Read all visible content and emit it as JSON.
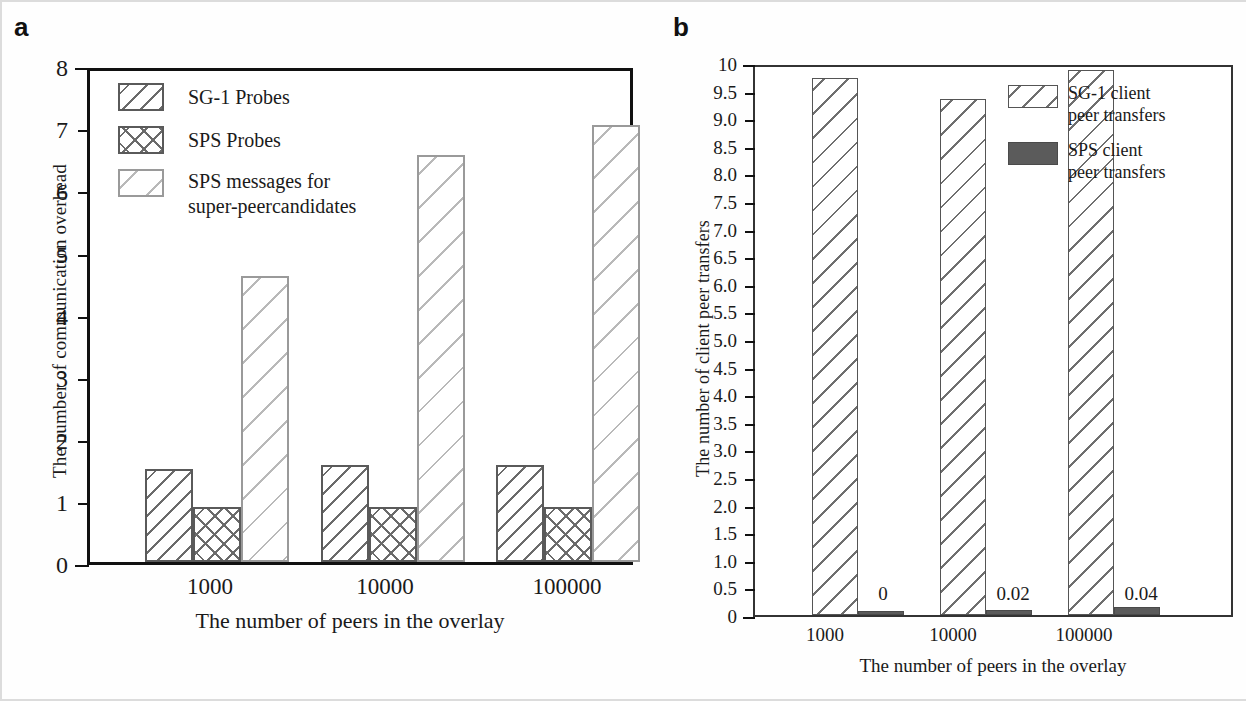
{
  "panels": {
    "a": {
      "letter": "a"
    },
    "b": {
      "letter": "b"
    }
  },
  "chart_data": [
    {
      "type": "bar",
      "panel": "a",
      "title": "",
      "xlabel": "The number of peers in the overlay",
      "ylabel": "The number of communication overhead",
      "categories": [
        "1000",
        "10000",
        "100000"
      ],
      "ylim": [
        0,
        8
      ],
      "yticks": [
        "0",
        "1",
        "2",
        "3",
        "4",
        "5",
        "6",
        "7",
        "8"
      ],
      "grid": false,
      "legend_position": "inside-top-left",
      "series": [
        {
          "name": "SG-1 Probes",
          "pattern": "dense-diagonal-hatch",
          "values": [
            1.5,
            1.56,
            1.56
          ]
        },
        {
          "name": "SPS Probes",
          "pattern": "cross-hatch",
          "values": [
            0.88,
            0.88,
            0.88
          ]
        },
        {
          "name": "SPS messages for\nsuper-peercandidates",
          "pattern": "light-diagonal-hatch",
          "values": [
            4.6,
            6.55,
            7.03
          ]
        }
      ]
    },
    {
      "type": "bar",
      "panel": "b",
      "title": "",
      "xlabel": "The number of peers in the overlay",
      "ylabel": "The number of client peer transfers",
      "categories": [
        "1000",
        "10000",
        "100000"
      ],
      "ylim": [
        0,
        10
      ],
      "yticks": [
        "0",
        "0.5",
        "1.0",
        "1.5",
        "2.0",
        "2.5",
        "3.0",
        "3.5",
        "4.0",
        "4.5",
        "5.0",
        "5.5",
        "6.0",
        "6.5",
        "7.0",
        "7.5",
        "8.0",
        "8.5",
        "9.0",
        "9.5",
        "10"
      ],
      "grid": false,
      "legend_position": "inside-top-right",
      "series": [
        {
          "name": "SG-1 client\npeer transfers",
          "pattern": "diagonal-hatch",
          "values": [
            9.73,
            9.34,
            9.88
          ]
        },
        {
          "name": "SPS client\npeer transfers",
          "pattern": "solid-dark-gray",
          "values": [
            0,
            0.02,
            0.04
          ],
          "data_labels": [
            "0",
            "0.02",
            "0.04"
          ]
        }
      ]
    }
  ],
  "colors": {
    "axis": "#111111",
    "hatch_dark": "#6b6b6b",
    "hatch_light": "#b9b9b9",
    "solid_dark": "#5b5b5b",
    "background": "#ffffff"
  }
}
